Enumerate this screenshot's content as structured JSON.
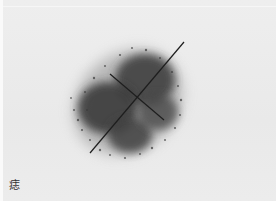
{
  "image": {
    "description": "Grayscale photo of a dark pigmented skin spot (mole) with two measurement lines crossing at its center",
    "caption": "痣",
    "colors": {
      "background": "#ebebeb",
      "spot": "#3c3c3c",
      "lines": "#1e1e1e"
    },
    "measurement_lines": [
      {
        "name": "long-axis",
        "x1": 90,
        "y1": 153,
        "x2": 184,
        "y2": 42
      },
      {
        "name": "short-axis",
        "x1": 110,
        "y1": 74,
        "x2": 164,
        "y2": 120
      }
    ]
  }
}
